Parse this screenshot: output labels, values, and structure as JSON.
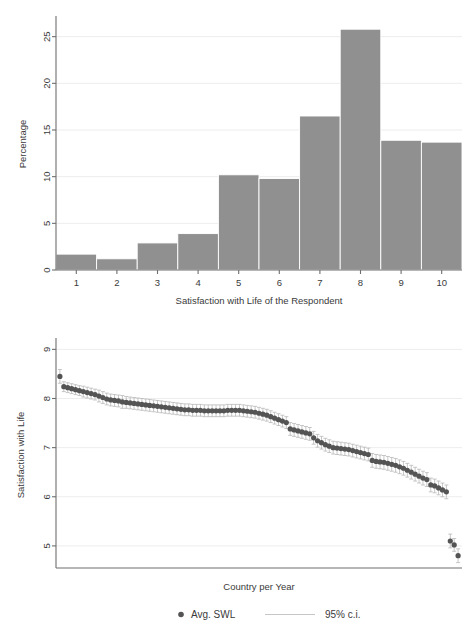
{
  "figure": {
    "background": "#ffffff",
    "bar_color": "#909090",
    "dot_color": "#545454",
    "ci_color": "#b7b7b7",
    "grid_color": "#ededed",
    "axis_color": "#6e6e6e"
  },
  "chart_data": [
    {
      "type": "bar",
      "id": "histogram-swl",
      "title": "",
      "xlabel": "Satisfaction with Life of the Respondent",
      "ylabel": "Percentage",
      "categories": [
        "1",
        "2",
        "3",
        "4",
        "5",
        "6",
        "7",
        "8",
        "9",
        "10"
      ],
      "values": [
        1.7,
        1.2,
        2.9,
        3.9,
        10.2,
        9.8,
        16.5,
        25.8,
        13.9,
        13.7
      ],
      "xlim": [
        0.5,
        10.5
      ],
      "ylim": [
        0,
        27
      ],
      "yticks": [
        0,
        5,
        10,
        15,
        20,
        25
      ],
      "ytick_labels": [
        "0",
        "5",
        "10",
        "15",
        "20",
        "25"
      ],
      "xticks": [
        1,
        2,
        3,
        4,
        5,
        6,
        7,
        8,
        9,
        10
      ],
      "xtick_labels": [
        "1",
        "2",
        "3",
        "4",
        "5",
        "6",
        "7",
        "8",
        "9",
        "10"
      ],
      "grid": "horizontal-only",
      "legend": null
    },
    {
      "type": "scatter",
      "id": "avg-swl-by-country-year",
      "title": "",
      "xlabel": "Country per Year",
      "ylabel": "Satisfaction with Life",
      "xlim": [
        0,
        104
      ],
      "ylim": [
        4.55,
        9.15
      ],
      "yticks": [
        5,
        6,
        7,
        8,
        9
      ],
      "ytick_labels": [
        "5",
        "6",
        "7",
        "8",
        "9"
      ],
      "xticks": [],
      "xtick_labels": [],
      "grid": "horizontal-only",
      "error_bars": "95% confidence interval",
      "legend": {
        "position": "below-axis",
        "entries": [
          {
            "label": "Avg. SWL",
            "marker": "filled-circle",
            "color": "#545454"
          },
          {
            "label": "95% c.i.",
            "marker": "horizontal-line",
            "color": "#b7b7b7"
          }
        ]
      },
      "series": [
        {
          "name": "Avg. SWL",
          "x": [
            1,
            2,
            3,
            4,
            5,
            6,
            7,
            8,
            9,
            10,
            11,
            12,
            13,
            14,
            15,
            16,
            17,
            18,
            19,
            20,
            21,
            22,
            23,
            24,
            25,
            26,
            27,
            28,
            29,
            30,
            31,
            32,
            33,
            34,
            35,
            36,
            37,
            38,
            39,
            40,
            41,
            42,
            43,
            44,
            45,
            46,
            47,
            48,
            49,
            50,
            51,
            52,
            53,
            54,
            55,
            56,
            57,
            58,
            59,
            60,
            61,
            62,
            63,
            64,
            65,
            66,
            67,
            68,
            69,
            70,
            71,
            72,
            73,
            74,
            75,
            76,
            77,
            78,
            79,
            80,
            81,
            82,
            83,
            84,
            85,
            86,
            87,
            88,
            89,
            90,
            91,
            92,
            93,
            94,
            95,
            96,
            97,
            98,
            99,
            100,
            101,
            102,
            103
          ],
          "y": [
            8.45,
            8.24,
            8.22,
            8.2,
            8.18,
            8.16,
            8.14,
            8.12,
            8.1,
            8.08,
            8.05,
            8.02,
            7.99,
            7.97,
            7.96,
            7.95,
            7.93,
            7.92,
            7.91,
            7.9,
            7.89,
            7.88,
            7.87,
            7.86,
            7.85,
            7.84,
            7.83,
            7.82,
            7.81,
            7.8,
            7.79,
            7.78,
            7.77,
            7.77,
            7.76,
            7.76,
            7.76,
            7.75,
            7.75,
            7.75,
            7.75,
            7.75,
            7.75,
            7.76,
            7.76,
            7.76,
            7.76,
            7.75,
            7.74,
            7.73,
            7.72,
            7.7,
            7.68,
            7.66,
            7.63,
            7.6,
            7.57,
            7.54,
            7.51,
            7.38,
            7.36,
            7.34,
            7.32,
            7.3,
            7.28,
            7.2,
            7.14,
            7.1,
            7.06,
            7.03,
            7.0,
            6.99,
            6.98,
            6.97,
            6.96,
            6.94,
            6.92,
            6.9,
            6.88,
            6.86,
            6.74,
            6.72,
            6.71,
            6.7,
            6.68,
            6.66,
            6.64,
            6.61,
            6.58,
            6.54,
            6.5,
            6.46,
            6.42,
            6.38,
            6.35,
            6.24,
            6.22,
            6.18,
            6.14,
            6.1,
            5.1,
            5.02,
            4.8
          ],
          "ci_half_width": [
            0.14,
            0.1,
            0.1,
            0.1,
            0.1,
            0.1,
            0.11,
            0.11,
            0.11,
            0.11,
            0.12,
            0.12,
            0.12,
            0.12,
            0.12,
            0.12,
            0.13,
            0.12,
            0.12,
            0.12,
            0.12,
            0.12,
            0.12,
            0.12,
            0.12,
            0.12,
            0.12,
            0.12,
            0.12,
            0.12,
            0.12,
            0.12,
            0.12,
            0.12,
            0.12,
            0.12,
            0.12,
            0.12,
            0.12,
            0.12,
            0.12,
            0.12,
            0.12,
            0.12,
            0.12,
            0.12,
            0.12,
            0.12,
            0.12,
            0.12,
            0.12,
            0.12,
            0.12,
            0.12,
            0.12,
            0.12,
            0.12,
            0.12,
            0.12,
            0.13,
            0.13,
            0.13,
            0.13,
            0.13,
            0.13,
            0.13,
            0.13,
            0.13,
            0.13,
            0.13,
            0.13,
            0.13,
            0.13,
            0.13,
            0.13,
            0.13,
            0.13,
            0.13,
            0.13,
            0.13,
            0.14,
            0.14,
            0.14,
            0.14,
            0.14,
            0.14,
            0.14,
            0.14,
            0.14,
            0.14,
            0.14,
            0.14,
            0.14,
            0.14,
            0.14,
            0.14,
            0.14,
            0.14,
            0.14,
            0.14,
            0.14,
            0.13,
            0.14
          ]
        }
      ]
    }
  ]
}
